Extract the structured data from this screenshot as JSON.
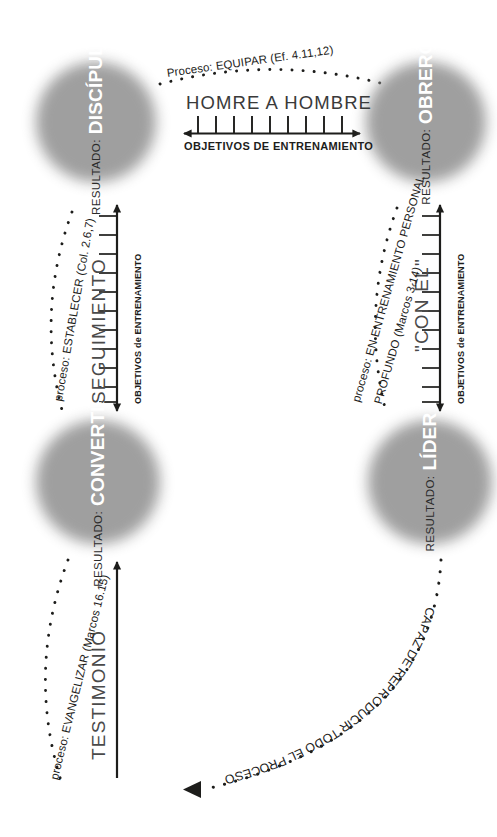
{
  "diagram": {
    "background_color": "#ffffff",
    "node_fill_color": "#9c9c9c",
    "node_label_color": "#ffffff",
    "line_color": "#1d1d1b"
  },
  "nodes": [
    {
      "id": "discipulo",
      "prefix": "RESULTADO:",
      "name": "DISCÍPULO",
      "position": "top-left"
    },
    {
      "id": "obrero",
      "prefix": "RESULTADO:",
      "name": "OBRERO",
      "position": "top-right"
    },
    {
      "id": "convertido",
      "prefix": "RESULTADO:",
      "name": "CONVERTIDO",
      "position": "bottom-left"
    },
    {
      "id": "lider",
      "prefix": "RESULTADO:",
      "name": "LÍDER",
      "position": "bottom-right"
    }
  ],
  "edges": {
    "top": {
      "process": "Proceso: EQUIPAR (Ef. 4.11,12)",
      "stage": "HOMRE A HOMBRE",
      "axis_caption": "OBJETIVOS DE ENTRENAMIENTO",
      "tick_count": 10,
      "arrow": "double",
      "from": "discipulo",
      "to": "obrero"
    },
    "left": {
      "process": "proceso: ESTABLECER (Col. 2.6,7)",
      "stage": "SEGUIMIENTO",
      "axis_caption": "OBJETIVOS de ENTRENAMIENTO",
      "tick_count": 11,
      "arrow": "double",
      "from": "convertido",
      "to": "discipulo"
    },
    "right": {
      "process_line1": "proceso: EN ENTRENAMIENTO PERSONAL",
      "process_line2": "PROFUNDO (Marcos 3.14)",
      "stage": "\"CON ÉL\"",
      "axis_caption": "OBJETIVOS de ENTRENAMIENTO",
      "tick_count": 11,
      "arrow": "double",
      "from": "obrero",
      "to": "lider"
    },
    "bottom_left": {
      "process": "proceso: EVANGELIZAR (Marcos 16.15)",
      "stage": "TESTIMONIO",
      "arrow": "single-up",
      "to": "convertido"
    },
    "bottom_curve": {
      "label": "CAPAZ DE REPRODUCIR TODO EL PROCESO",
      "arrow": "single-left",
      "from": "lider"
    }
  }
}
